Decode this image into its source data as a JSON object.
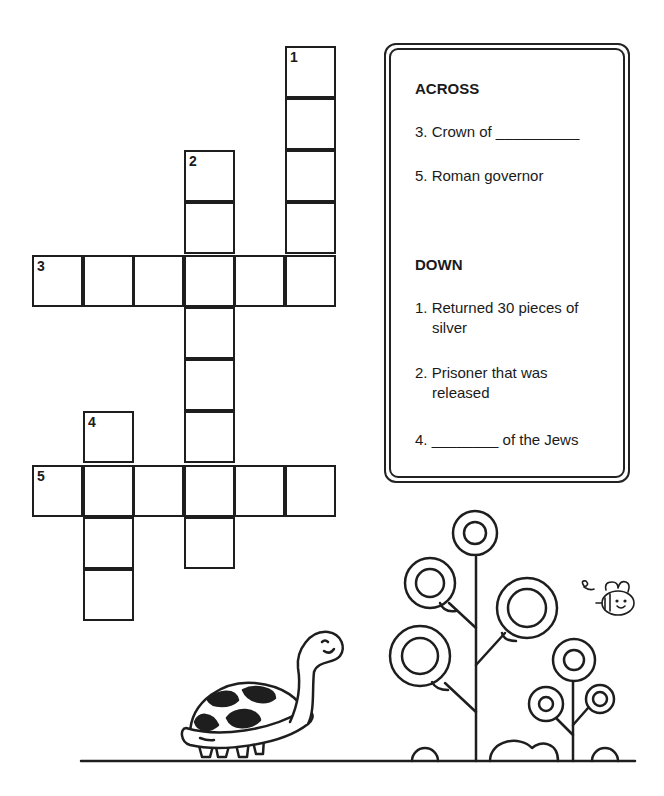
{
  "puzzle": {
    "cell_size": 51,
    "cells": [
      {
        "x": 285,
        "y": 46,
        "num": "1"
      },
      {
        "x": 285,
        "y": 98
      },
      {
        "x": 285,
        "y": 150
      },
      {
        "x": 285,
        "y": 202
      },
      {
        "x": 184,
        "y": 150,
        "num": "2"
      },
      {
        "x": 184,
        "y": 202
      },
      {
        "x": 32,
        "y": 255,
        "num": "3"
      },
      {
        "x": 83,
        "y": 255
      },
      {
        "x": 133,
        "y": 255
      },
      {
        "x": 184,
        "y": 255
      },
      {
        "x": 234,
        "y": 255
      },
      {
        "x": 285,
        "y": 255
      },
      {
        "x": 184,
        "y": 307
      },
      {
        "x": 184,
        "y": 359
      },
      {
        "x": 184,
        "y": 411
      },
      {
        "x": 83,
        "y": 411,
        "num": "4"
      },
      {
        "x": 32,
        "y": 465,
        "num": "5"
      },
      {
        "x": 83,
        "y": 465
      },
      {
        "x": 133,
        "y": 465
      },
      {
        "x": 184,
        "y": 465
      },
      {
        "x": 234,
        "y": 465
      },
      {
        "x": 285,
        "y": 465
      },
      {
        "x": 83,
        "y": 517
      },
      {
        "x": 83,
        "y": 569
      },
      {
        "x": 184,
        "y": 517
      }
    ]
  },
  "clues": {
    "across_heading": "ACROSS",
    "across": [
      {
        "label": "3. Crown of __________"
      },
      {
        "label": "5. Roman governor"
      }
    ],
    "down_heading": "DOWN",
    "down": [
      {
        "line1": "1. Returned 30 pieces of",
        "line2": "silver"
      },
      {
        "line1": "2. Prisoner that was",
        "line2": "released"
      },
      {
        "line1": "4. ________ of the Jews"
      }
    ]
  },
  "illustrations": {
    "turtle": "turtle-illustration",
    "tree": "tree-illustration",
    "bee": "bee-illustration"
  }
}
